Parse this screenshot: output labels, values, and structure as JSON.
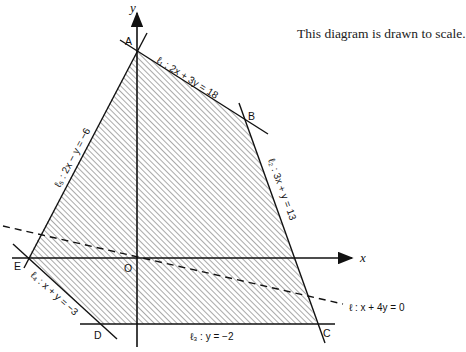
{
  "note": "This diagram is drawn to scale.",
  "axes": {
    "x_label": "x",
    "y_label": "y",
    "origin_label": "O"
  },
  "points": {
    "A": {
      "label": "A",
      "coords": [
        0,
        6
      ]
    },
    "B": {
      "label": "B",
      "coords": [
        3,
        4
      ]
    },
    "C": {
      "label": "C",
      "coords": [
        5,
        -2
      ]
    },
    "D": {
      "label": "D",
      "coords": [
        -1,
        -2
      ]
    },
    "E": {
      "label": "E",
      "coords": [
        -3,
        0
      ]
    }
  },
  "lines": {
    "l1": {
      "label": "ℓ₁ : 2x + 3y = 18"
    },
    "l2": {
      "label": "ℓ₂ : 3x + y = 13"
    },
    "l3": {
      "label": "ℓ₃ : y = −2"
    },
    "l4": {
      "label": "ℓ₄ : x + y = −3"
    },
    "l5": {
      "label": "ℓ₅ : 2x − y = −6"
    },
    "l": {
      "label": "ℓ : x + 4y = 0",
      "style": "dashed"
    }
  },
  "region": {
    "vertices": [
      "A",
      "B",
      "C",
      "D",
      "E"
    ],
    "fill": "hatched"
  },
  "colors": {
    "line": "#111111",
    "hatch": "#555555",
    "background": "#ffffff"
  }
}
